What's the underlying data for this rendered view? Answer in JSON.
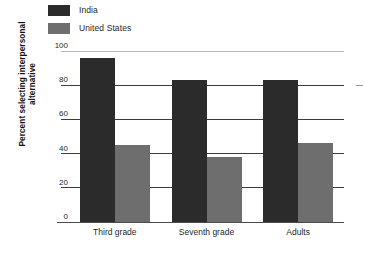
{
  "chart_data": {
    "type": "bar",
    "title": "",
    "xlabel": "",
    "ylabel": "Percent selecting interpersonal alternative",
    "ylabel_line1": "Percent selecting interpersonal",
    "ylabel_line2": "alternative",
    "categories": [
      "Third grade",
      "Seventh grade",
      "Adults"
    ],
    "series": [
      {
        "name": "India",
        "color": "#2b2b2b",
        "values": [
          96,
          83,
          83
        ]
      },
      {
        "name": "United States",
        "color": "#6e6e6e",
        "values": [
          45,
          38,
          46
        ]
      }
    ],
    "ylim": [
      0,
      100
    ],
    "yticks": [
      0,
      20,
      40,
      60,
      80,
      100
    ],
    "ytick_labels": [
      "0",
      "20",
      "40",
      "60",
      "80",
      "100"
    ],
    "grid": true,
    "legend_position": "top-left",
    "orientation": "vertical"
  },
  "legend": {
    "items": [
      {
        "label": "India",
        "color": "#2b2b2b"
      },
      {
        "label": "United States",
        "color": "#6e6e6e"
      }
    ]
  }
}
